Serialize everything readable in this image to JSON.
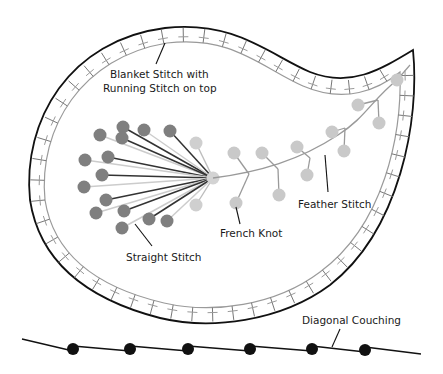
{
  "diagram": {
    "type": "embroidery-stitch-diagram",
    "colors": {
      "background": "#ffffff",
      "outline": "#111111",
      "inner_line": "#9a9a9a",
      "straight_dark_dot": "#7f7f7f",
      "straight_dark_line": "#333333",
      "straight_light_line": "#cccccc",
      "feather_knot": "#c9c9c9",
      "feather_line": "#9a9a9a",
      "couching_dot": "#111111",
      "text": "#1a1a1a"
    },
    "labels": {
      "blanket": {
        "line1": "Blanket Stitch with",
        "line2": "Running Stitch on top"
      },
      "straight": "Straight Stitch",
      "french_knot": "French Knot",
      "feather": "Feather Stitch",
      "couching": "Diagonal Couching"
    }
  }
}
